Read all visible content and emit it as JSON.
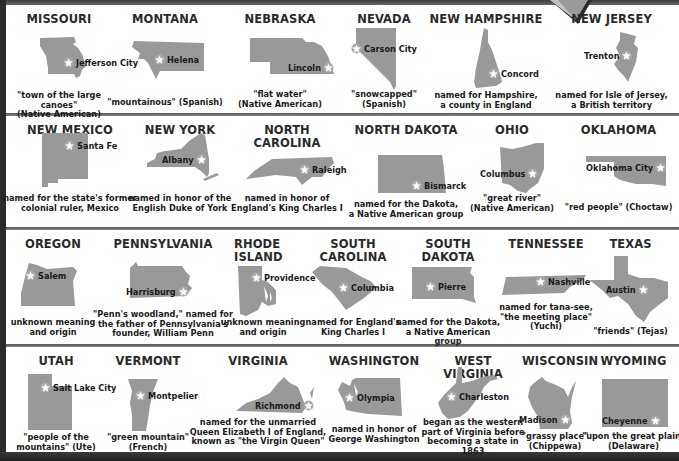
{
  "colors": {
    "map_fill": "#999999",
    "star_fill": "#ffffff",
    "frame": "#2b2b2b",
    "text": "#231f20"
  },
  "rows": [
    {
      "states": [
        {
          "name": "MISSOURI",
          "capital": "Jefferson City",
          "origin": "\"town of the large canoes\" (Native American)",
          "origin_lines": [
            "\"town of the large canoes\"",
            "(Native American)"
          ]
        },
        {
          "name": "MONTANA",
          "capital": "Helena",
          "origin": "\"mountainous\" (Spanish)",
          "origin_lines": [
            "\"mountainous\" (Spanish)"
          ]
        },
        {
          "name": "NEBRASKA",
          "capital": "Lincoln",
          "origin": "\"flat water\" (Native American)",
          "origin_lines": [
            "\"flat water\"",
            "(Native American)"
          ]
        },
        {
          "name": "NEVADA",
          "capital": "Carson City",
          "origin": "\"snowcapped\" (Spanish)",
          "origin_lines": [
            "\"snowcapped\"",
            "(Spanish)"
          ]
        },
        {
          "name": "NEW HAMPSHIRE",
          "capital": "Concord",
          "origin": "named for Hampshire, a county in England",
          "origin_lines": [
            "named for Hampshire,",
            "a county in England"
          ]
        },
        {
          "name": "NEW JERSEY",
          "capital": "Trenton",
          "origin": "named for Isle of Jersey, a British territory",
          "origin_lines": [
            "named for Isle of Jersey,",
            "a British territory"
          ]
        }
      ]
    },
    {
      "states": [
        {
          "name": "NEW MEXICO",
          "capital": "Santa Fe",
          "origin": "named for the state's former colonial ruler, Mexico",
          "origin_lines": [
            "named for the state's former",
            "colonial ruler, Mexico"
          ]
        },
        {
          "name": "NEW YORK",
          "capital": "Albany",
          "origin": "named in honor of the English Duke of York",
          "origin_lines": [
            "named in honor of the",
            "English Duke of York"
          ]
        },
        {
          "name": "NORTH CAROLINA",
          "name_lines": [
            "NORTH",
            "CAROLINA"
          ],
          "capital": "Raleigh",
          "origin": "named in honor of England's King Charles I",
          "origin_lines": [
            "named in honor of",
            "England's King Charles I"
          ]
        },
        {
          "name": "NORTH DAKOTA",
          "capital": "Bismarck",
          "origin": "named for the Dakota, a Native American group",
          "origin_lines": [
            "named for the Dakota,",
            "a Native American group"
          ]
        },
        {
          "name": "OHIO",
          "capital": "Columbus",
          "origin": "\"great river\" (Native American)",
          "origin_lines": [
            "\"great river\"",
            "(Native American)"
          ]
        },
        {
          "name": "OKLAHOMA",
          "capital": "Oklahoma City",
          "origin": "\"red people\" (Choctaw)",
          "origin_lines": [
            "\"red people\" (Choctaw)"
          ]
        }
      ]
    },
    {
      "states": [
        {
          "name": "OREGON",
          "capital": "Salem",
          "origin": "unknown meaning and origin",
          "origin_lines": [
            "unknown meaning",
            "and origin"
          ]
        },
        {
          "name": "PENNSYLVANIA",
          "capital": "Harrisburg",
          "origin": "\"Penn's woodland,\" named for the father of Pennsylvania's founder, William Penn",
          "origin_lines": [
            "\"Penn's woodland,\" named for",
            "the father of Pennsylvania's",
            "founder, William Penn"
          ]
        },
        {
          "name": "RHODE ISLAND",
          "name_lines": [
            "RHODE",
            "ISLAND"
          ],
          "capital": "Providence",
          "origin": "unknown meaning and origin",
          "origin_lines": [
            "unknown meaning",
            "and origin"
          ]
        },
        {
          "name": "SOUTH CAROLINA",
          "name_lines": [
            "SOUTH",
            "CAROLINA"
          ],
          "capital": "Columbia",
          "origin": "named for England's King Charles I",
          "origin_lines": [
            "named for England's",
            "King Charles I"
          ]
        },
        {
          "name": "SOUTH DAKOTA",
          "capital": "Pierre",
          "origin": "named for the Dakota, a Native American group",
          "origin_lines": [
            "named for the Dakota,",
            "a Native American group"
          ]
        },
        {
          "name": "TENNESSEE",
          "capital": "Nashville",
          "origin": "named for tana-see, \"the meeting place\" (Yuchi)",
          "origin_lines": [
            "named for tana-see,",
            "\"the meeting place\"",
            "(Yuchi)"
          ]
        },
        {
          "name": "TEXAS",
          "capital": "Austin",
          "origin": "\"friends\" (Tejas)",
          "origin_lines": [
            "\"friends\" (Tejas)"
          ]
        }
      ]
    },
    {
      "states": [
        {
          "name": "UTAH",
          "capital": "Salt Lake City",
          "origin": "\"people of the mountains\" (Ute)",
          "origin_lines": [
            "\"people of the",
            "mountains\" (Ute)"
          ]
        },
        {
          "name": "VERMONT",
          "capital": "Montpelier",
          "origin": "\"green mountain\" (French)",
          "origin_lines": [
            "\"green mountain\"",
            "(French)"
          ]
        },
        {
          "name": "VIRGINIA",
          "capital": "Richmond",
          "origin": "named for the unmarried Queen Elizabeth I of England, known as \"the Virgin Queen\"",
          "origin_lines": [
            "named for the unmarried",
            "Queen Elizabeth I of England,",
            "known as \"the Virgin Queen\""
          ]
        },
        {
          "name": "WASHINGTON",
          "capital": "Olympia",
          "origin": "named in honor of George Washington",
          "origin_lines": [
            "named in honor of",
            "George Washington"
          ]
        },
        {
          "name": "WEST VIRGINIA",
          "capital": "Charleston",
          "origin": "began as the western part of Virginia before becoming a state in 1863",
          "origin_lines": [
            "began as the western",
            "part of Virginia before",
            "becoming a state in 1863"
          ]
        },
        {
          "name": "WISCONSIN",
          "capital": "Madison",
          "origin": "\"grassy place\" (Chippewa)",
          "origin_lines": [
            "\"grassy place\"",
            "(Chippewa)"
          ]
        },
        {
          "name": "WYOMING",
          "capital": "Cheyenne",
          "origin": "\"upon the great plain\" (Delaware)",
          "origin_lines": [
            "\"upon the great plain\"",
            "(Delaware)"
          ]
        }
      ]
    }
  ]
}
